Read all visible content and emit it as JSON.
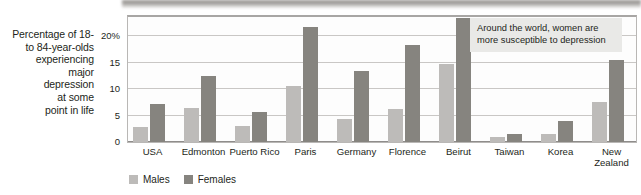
{
  "chart_data": {
    "type": "bar",
    "title": "",
    "xlabel": "",
    "ylabel": "Percentage of 18- to 84-year-olds experiencing major depression at some point in life",
    "ylim": [
      0,
      24
    ],
    "yticks": [
      0,
      5,
      10,
      15,
      20
    ],
    "ytick_labels": [
      "0",
      "5",
      "10",
      "15",
      "20%"
    ],
    "grid": true,
    "legend_position": "bottom-left",
    "categories": [
      "USA",
      "Edmonton",
      "Puerto Rico",
      "Paris",
      "Germany",
      "Florence",
      "Beirut",
      "Taiwan",
      "Korea",
      "New Zealand"
    ],
    "series": [
      {
        "name": "Males",
        "color": "#bdbbb9",
        "values": [
          2.8,
          6.4,
          3.1,
          10.5,
          4.4,
          6.2,
          14.7,
          1.0,
          1.6,
          7.5
        ]
      },
      {
        "name": "Females",
        "color": "#86847f",
        "values": [
          7.2,
          12.4,
          5.7,
          21.8,
          13.4,
          18.3,
          23.4,
          1.6,
          3.9,
          15.5
        ]
      }
    ],
    "annotations": [
      {
        "text": "Around the world, women are more susceptible to depression",
        "background": "#e9e9e7"
      }
    ]
  },
  "axis_caption": {
    "lines": [
      "Percentage of 18-",
      "to 84-year-olds",
      "experiencing",
      "major",
      "depression",
      "at some",
      "point in life"
    ]
  }
}
